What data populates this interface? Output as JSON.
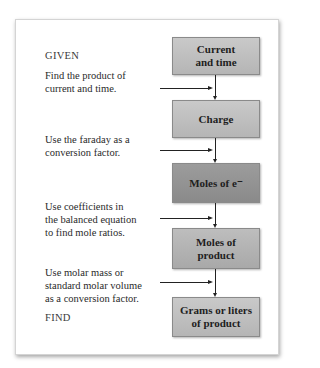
{
  "diagram": {
    "given_label": "GIVEN",
    "find_label": "FIND",
    "boxes": [
      {
        "text": "Current\nand time",
        "shade": "light"
      },
      {
        "text": "Charge",
        "shade": "light"
      },
      {
        "text": "Moles of e⁻",
        "shade": "dark"
      },
      {
        "text": "Moles of\nproduct",
        "shade": "mid"
      },
      {
        "text": "Grams or liters\nof product",
        "shade": "light"
      }
    ],
    "steps": [
      "Find the product of\ncurrent and time.",
      "Use the faraday as a\nconversion factor.",
      "Use coefficients in\nthe balanced equation\nto find mole ratios.",
      "Use molar mass or\nstandard molar volume\nas a conversion factor."
    ]
  },
  "colors": {
    "box_light": "#bfbfbf",
    "box_mid": "#b3b3b3",
    "box_dark": "#939393",
    "arrow": "#222222"
  }
}
